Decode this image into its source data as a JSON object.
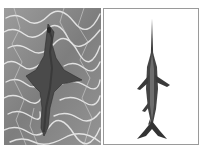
{
  "figure": {
    "panels": [
      {
        "id": "left",
        "subject": "guitarfish-in-water",
        "description": "Grayscale photo of a ray-like fish (guitarfish) swimming over rippling sunlit water",
        "background": "#8a8a8a"
      },
      {
        "id": "right",
        "subject": "swordfish",
        "description": "Grayscale illustration of a swordfish viewed from above on a white background",
        "background": "#ffffff",
        "border": "#9a9a9a"
      }
    ]
  }
}
